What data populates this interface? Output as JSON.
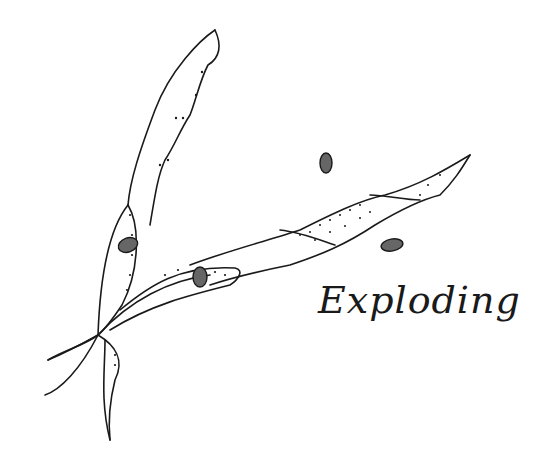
{
  "illustration": {
    "subject": "exploding seed pods",
    "caption": "Exploding",
    "ink_color": "#1a1a1a",
    "background_color": "#ffffff",
    "elements": {
      "pods": [
        "upper-curved-pod",
        "twisted-diagonal-pod",
        "lower-open-pod-left",
        "lower-open-pod-right"
      ],
      "seeds_count": 5
    }
  }
}
